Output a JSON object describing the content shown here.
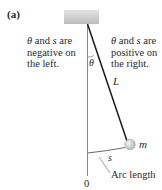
{
  "figure": {
    "panel_label": "(a)",
    "left_note": {
      "line1_sym1": "θ",
      "line1_rest": " and ",
      "line1_sym2": "s",
      "line1_end": " are",
      "line2": "negative on",
      "line3": "the left."
    },
    "right_note": {
      "line1_sym1": "θ",
      "line1_rest": " and ",
      "line1_sym2": "s",
      "line1_end": " are",
      "line2": "positive on",
      "line3": "the right."
    },
    "angle_label": "θ",
    "length_label": "L",
    "mass_label": "m",
    "arc_label": "s",
    "arc_caption": "Arc length",
    "origin_label": "0",
    "colors": {
      "ceiling": "#c9c9c9",
      "string": "#1a1a1a",
      "vertical_line": "#8a8a8a",
      "bob": "#d6d6d6",
      "arc": "#6a6a6a"
    }
  }
}
